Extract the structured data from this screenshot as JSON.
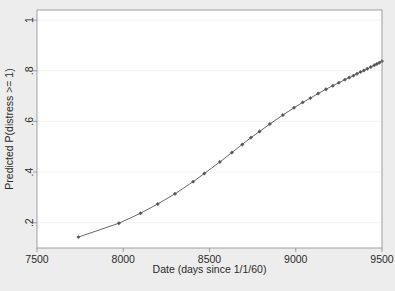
{
  "figure": {
    "background_color": "#ededed",
    "plot_background_color": "#ffffff",
    "frame_color": "#8a8a8a",
    "grid_color": "#f2f2f2",
    "series_color": "#555555",
    "marker_color": "#555555"
  },
  "chart_data": {
    "type": "line",
    "title": "",
    "subtitle": "",
    "xlabel": "Date (days since 1/1/60)",
    "ylabel": "Predicted P(distress >= 1)",
    "xlim": [
      7500,
      9500
    ],
    "ylim": [
      0.1,
      1.04
    ],
    "xticks": [
      7500,
      8000,
      8500,
      9000,
      9500
    ],
    "xticklabels": [
      "7500",
      "8000",
      "8500",
      "9000",
      "9500"
    ],
    "yticks": [
      0.2,
      0.4,
      0.6,
      0.8,
      1
    ],
    "yticklabels": [
      ".2",
      ".4",
      ".6",
      ".8",
      "1"
    ],
    "grid": "horizontal",
    "legend": "none",
    "marker": "diamond",
    "series": [
      {
        "name": "Predicted P(distress >= 1)",
        "x": [
          7740,
          7975,
          8100,
          8200,
          8300,
          8405,
          8470,
          8560,
          8630,
          8690,
          8740,
          8790,
          8850,
          8925,
          8990,
          9040,
          9085,
          9130,
          9175,
          9215,
          9250,
          9285,
          9310,
          9335,
          9355,
          9375,
          9395,
          9415,
          9435,
          9455,
          9470,
          9485,
          9500
        ],
        "y": [
          0.143,
          0.198,
          0.237,
          0.274,
          0.314,
          0.362,
          0.394,
          0.44,
          0.477,
          0.509,
          0.536,
          0.56,
          0.59,
          0.625,
          0.654,
          0.675,
          0.692,
          0.71,
          0.727,
          0.741,
          0.753,
          0.765,
          0.773,
          0.781,
          0.788,
          0.795,
          0.801,
          0.808,
          0.815,
          0.822,
          0.827,
          0.832,
          0.838
        ]
      }
    ]
  }
}
